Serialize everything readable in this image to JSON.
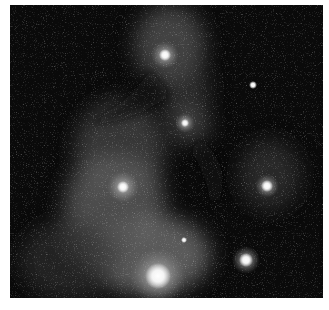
{
  "image": {
    "subject": "astronomical-nebula-photograph",
    "tone": "grayscale",
    "background_color": "#0b0b0b",
    "stars": [
      {
        "name": "bright-star-top",
        "cx": 165,
        "cy": 55,
        "r": 6
      },
      {
        "name": "star-upper-right",
        "cx": 253,
        "cy": 85,
        "r": 3
      },
      {
        "name": "star-middle",
        "cx": 185,
        "cy": 123,
        "r": 4
      },
      {
        "name": "bright-star-left",
        "cx": 123,
        "cy": 187,
        "r": 6
      },
      {
        "name": "bright-star-right",
        "cx": 267,
        "cy": 186,
        "r": 6
      },
      {
        "name": "star-lower",
        "cx": 184,
        "cy": 240,
        "r": 3
      },
      {
        "name": "bright-star-bottom-right",
        "cx": 246,
        "cy": 260,
        "r": 7
      },
      {
        "name": "brightest-star-bottom",
        "cx": 158,
        "cy": 276,
        "r": 12
      }
    ]
  },
  "caption": {
    "text": ""
  }
}
